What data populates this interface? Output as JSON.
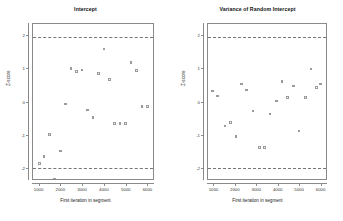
{
  "chart_data": [
    {
      "type": "scatter",
      "title": "Intercept",
      "xlabel": "First iteration in segment",
      "ylabel": "Z-score",
      "xlim": [
        700,
        6300
      ],
      "ylim": [
        -2.35,
        2.35
      ],
      "xticks": [
        1000,
        2000,
        3000,
        4000,
        5000,
        6000
      ],
      "xticklabels": [
        "1000",
        "2000",
        "3000",
        "4000",
        "5000",
        "6000"
      ],
      "yticks": [
        -2,
        -1,
        0,
        1,
        2
      ],
      "yticklabels": [
        "-2",
        "-1",
        "0",
        "1",
        "2"
      ],
      "grid": false,
      "legend": false,
      "reference_lines": [
        1.96,
        -1.96
      ],
      "x": [
        1000,
        1200,
        1450,
        1700,
        1950,
        2200,
        2450,
        2700,
        2950,
        3200,
        3450,
        3700,
        3950,
        4200,
        4450,
        4700,
        4950,
        5200,
        5450,
        5700,
        5950
      ],
      "y": [
        -1.82,
        -1.62,
        -0.95,
        -2.3,
        -1.45,
        -0.05,
        1.02,
        0.93,
        0.97,
        -0.22,
        -0.45,
        0.87,
        1.6,
        0.68,
        -0.62,
        -0.62,
        -0.62,
        1.2,
        0.95,
        -0.12,
        -0.12
      ]
    },
    {
      "type": "scatter",
      "title": "Variance of Random Intercept",
      "xlabel": "First iteration in segment",
      "ylabel": "Z-score",
      "xlim": [
        700,
        6300
      ],
      "ylim": [
        -2.35,
        2.35
      ],
      "xticks": [
        1000,
        2000,
        3000,
        4000,
        5000,
        6000
      ],
      "xticklabels": [
        "1000",
        "2000",
        "3000",
        "4000",
        "5000",
        "6000"
      ],
      "yticks": [
        -2,
        -1,
        0,
        1,
        2
      ],
      "yticklabels": [
        "-2",
        "-1",
        "0",
        "1",
        "2"
      ],
      "grid": false,
      "legend": false,
      "reference_lines": [
        1.96,
        -1.96
      ],
      "x": [
        900,
        1150,
        1500,
        1750,
        2000,
        2250,
        2500,
        2800,
        3100,
        3350,
        3600,
        3900,
        4150,
        4400,
        4700,
        4950,
        5250,
        5500,
        5750,
        5950
      ],
      "y": [
        0.35,
        0.2,
        -0.7,
        -0.6,
        -1.02,
        0.55,
        0.38,
        -0.25,
        -1.35,
        -1.35,
        -0.35,
        0.05,
        0.62,
        0.15,
        0.5,
        -0.85,
        0.15,
        1.0,
        0.45,
        0.55
      ]
    }
  ],
  "panels": [
    {
      "name": "intercept",
      "title": "Intercept",
      "xlabel": "First iteration in segment",
      "ylabel": "Z-score"
    },
    {
      "name": "variance-of-random-intercept",
      "title": "Variance of Random Intercept",
      "xlabel": "First iteration in segment",
      "ylabel": "Z-score"
    }
  ],
  "style": {
    "point_color": "#9a9a9a",
    "axis_color": "#8a8a8a",
    "refline_color": "#777777",
    "background": "#ffffff",
    "text_color": "#222222"
  }
}
